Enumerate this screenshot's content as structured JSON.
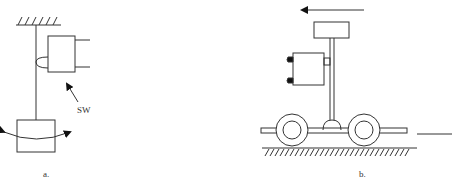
{
  "figure": {
    "panel_a": {
      "caption": "a.",
      "switch_label": "SW",
      "components": [
        "fixed-support",
        "pendulum-rod",
        "switch-box",
        "contact-bump",
        "pendulum-mass",
        "swing-arrow",
        "pointer-arrow"
      ]
    },
    "panel_b": {
      "caption": "b.",
      "components": [
        "motion-arrow",
        "top-mass",
        "vertical-post",
        "switch-box",
        "contact-terminals",
        "cart-chassis",
        "wheel-left",
        "wheel-right",
        "pivot-dome",
        "ground-hatch",
        "right-line"
      ]
    },
    "colors": {
      "stroke": "#333333",
      "background": "#ffffff"
    }
  }
}
